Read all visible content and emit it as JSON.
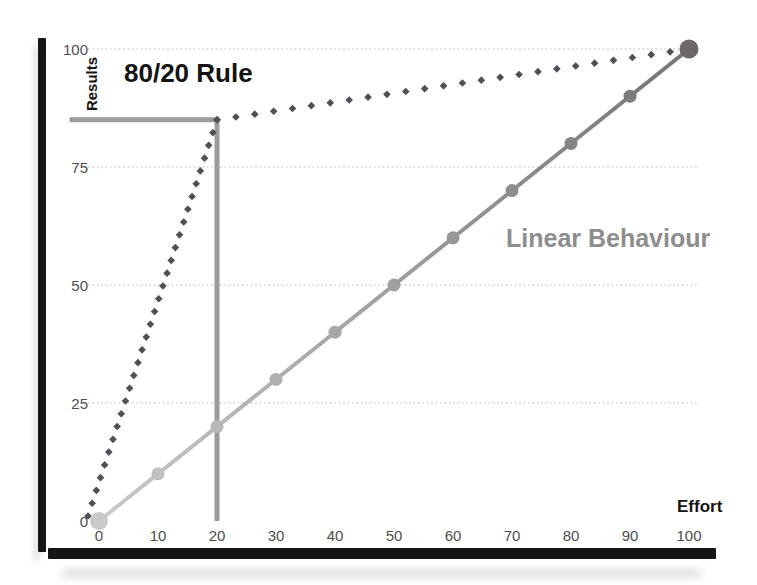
{
  "chart_data": {
    "type": "line",
    "title": "80/20 Rule",
    "xlabel": "Effort",
    "ylabel": "Results",
    "xlim": [
      0,
      100
    ],
    "ylim": [
      0,
      100
    ],
    "x_ticks": [
      0,
      10,
      20,
      30,
      40,
      50,
      60,
      70,
      80,
      90,
      100
    ],
    "y_ticks": [
      0,
      25,
      50,
      75,
      100
    ],
    "grid": "horizontal-dotted",
    "grid_color": "#cfcfcf",
    "axis_bar_color": "#161616",
    "series": [
      {
        "name": "80/20 Rule",
        "style": "dotted-diamond",
        "color": "#534e55",
        "points": [
          [
            0,
            0
          ],
          [
            20,
            85
          ],
          [
            100,
            100
          ]
        ]
      },
      {
        "name": "Linear Behaviour",
        "style": "line-circle-markers",
        "color_start": "#c9c9c9",
        "color_end": "#767276",
        "points": [
          [
            0,
            0
          ],
          [
            10,
            10
          ],
          [
            20,
            20
          ],
          [
            30,
            30
          ],
          [
            40,
            40
          ],
          [
            50,
            50
          ],
          [
            60,
            60
          ],
          [
            70,
            70
          ],
          [
            80,
            80
          ],
          [
            90,
            90
          ],
          [
            100,
            100
          ]
        ]
      }
    ],
    "reference_lines": {
      "x": 20,
      "y": 85,
      "h_from_x": -5,
      "color": "#9b9b9b"
    },
    "end_marker": {
      "x": 100,
      "y": 100,
      "color": "#6a666a"
    }
  }
}
